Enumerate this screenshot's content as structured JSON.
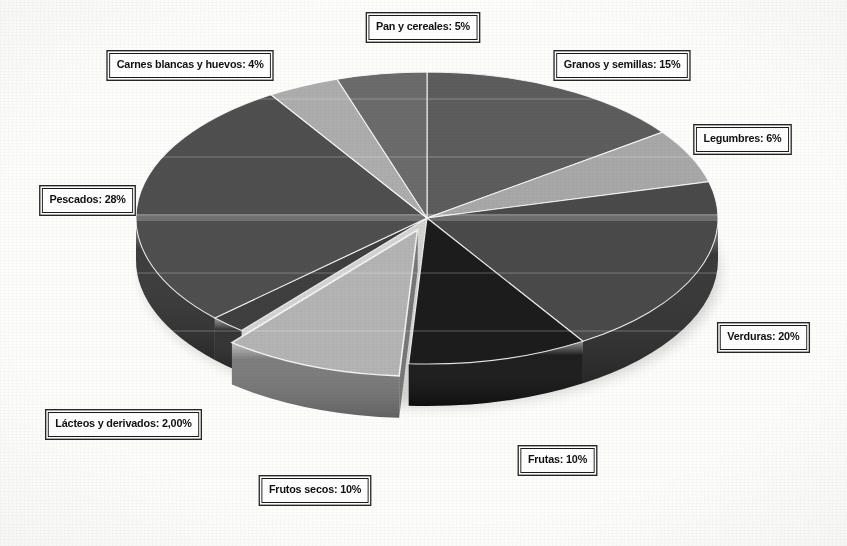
{
  "figure": {
    "kind": "pie-chart-3d",
    "background_color": "#fdfdfc"
  },
  "chart_data": {
    "type": "pie",
    "title": "",
    "subtitle": "",
    "xlabel": "",
    "ylabel": "",
    "grid": false,
    "legend_position": "none",
    "labels_format": "callout-boxes-around-chart",
    "units": "percent",
    "total": 100,
    "start_angle_deg": 0,
    "direction": "clockwise",
    "three_d": true,
    "categories": [
      "Granos y semillas",
      "Legumbres",
      "Verduras",
      "Frutas",
      "Frutos secos",
      "Lácteos y derivados",
      "Pescados",
      "Carnes blancas y huevos",
      "Pan y cereales"
    ],
    "values": [
      15,
      6,
      20,
      10,
      10,
      2,
      28,
      4,
      5
    ],
    "value_texts": [
      "15%",
      "6%",
      "20%",
      "10%",
      "10%",
      "2,00%",
      "28%",
      "4%",
      "5%"
    ],
    "colors": [
      "#5d5d5d",
      "#a8a8a8",
      "#4a4a4a",
      "#1c1c1c",
      "#b4b4b4",
      "#3f3f3f",
      "#4f4f4f",
      "#adadad",
      "#6b6b6b"
    ],
    "exploded_slices": [
      "Frutos secos"
    ],
    "slices": [
      {
        "name": "Granos y semillas",
        "value": 15,
        "label": "Granos y semillas: 15%",
        "color": "#5d5d5d",
        "side_color": "#3b3b3b",
        "exploded": false
      },
      {
        "name": "Legumbres",
        "value": 6,
        "label": "Legumbres: 6%",
        "color": "#a8a8a8",
        "side_color": "#6f6f6f",
        "exploded": false
      },
      {
        "name": "Verduras",
        "value": 20,
        "label": "Verduras: 20%",
        "color": "#4a4a4a",
        "side_color": "#2f2f2f",
        "exploded": false
      },
      {
        "name": "Frutas",
        "value": 10,
        "label": "Frutas: 10%",
        "color": "#1c1c1c",
        "side_color": "#121212",
        "exploded": false
      },
      {
        "name": "Frutos secos",
        "value": 10,
        "label": "Frutos secos: 10%",
        "color": "#b4b4b4",
        "side_color": "#777777",
        "exploded": true
      },
      {
        "name": "Lácteos y derivados",
        "value": 2,
        "label": "Lácteos y derivados: 2,00%",
        "color": "#3f3f3f",
        "side_color": "#2a2a2a",
        "exploded": false
      },
      {
        "name": "Pescados",
        "value": 28,
        "label": "Pescados: 28%",
        "color": "#4f4f4f",
        "side_color": "#333333",
        "exploded": false
      },
      {
        "name": "Carnes blancas y huevos",
        "value": 4,
        "label": "Carnes blancas y huevos: 4%",
        "color": "#adadad",
        "side_color": "#737373",
        "exploded": false
      },
      {
        "name": "Pan y cereales",
        "value": 5,
        "label": "Pan y cereales: 5%",
        "color": "#6b6b6b",
        "side_color": "#454545",
        "exploded": false
      }
    ]
  },
  "callouts": [
    {
      "id": "pan-y-cereales",
      "text": "Pan y cereales: 5%",
      "x": 423,
      "y": 27,
      "anchor": "center"
    },
    {
      "id": "carnes-blancas-y-huevos",
      "text": "Carnes blancas y huevos: 4%",
      "x": 190,
      "y": 65,
      "anchor": "center"
    },
    {
      "id": "granos-y-semillas",
      "text": "Granos y semillas: 15%",
      "x": 622,
      "y": 65,
      "anchor": "center"
    },
    {
      "id": "legumbres",
      "text": "Legumbres: 6%",
      "x": 742,
      "y": 139,
      "anchor": "center"
    },
    {
      "id": "pescados",
      "text": "Pescados: 28%",
      "x": 87,
      "y": 200,
      "anchor": "center"
    },
    {
      "id": "verduras",
      "text": "Verduras: 20%",
      "x": 763,
      "y": 337,
      "anchor": "center"
    },
    {
      "id": "lacteos-y-derivados",
      "text": "Lácteos y derivados: 2,00%",
      "x": 123,
      "y": 424,
      "anchor": "center"
    },
    {
      "id": "frutas",
      "text": "Frutas: 10%",
      "x": 557,
      "y": 460,
      "anchor": "center"
    },
    {
      "id": "frutos-secos",
      "text": "Frutos secos: 10%",
      "x": 315,
      "y": 490,
      "anchor": "center"
    }
  ],
  "geometry": {
    "center_x": 427,
    "center_y": 218,
    "radius_x": 291,
    "radius_y": 146,
    "depth": 42
  }
}
